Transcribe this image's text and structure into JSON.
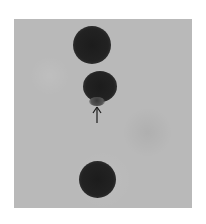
{
  "image": {
    "description": "Grayscale photograph showing three dark circular spots aligned vertically on a gray background, with an upward-pointing arrow indicating a small protrusion below the middle spot.",
    "background_color": "#b9b9b9",
    "spot_color": "#1c1c1c",
    "spots": [
      {
        "id": "top",
        "cx": 92,
        "cy": 45,
        "rx": 19,
        "ry": 19
      },
      {
        "id": "middle",
        "cx": 100,
        "cy": 86,
        "rx": 17,
        "ry": 15
      },
      {
        "id": "bottom",
        "cx": 97,
        "cy": 179,
        "rx": 18,
        "ry": 18
      }
    ],
    "annotation": {
      "type": "arrow",
      "direction": "up",
      "glyph": "↑",
      "x": 97,
      "y_top": 107,
      "y_bottom": 122
    }
  }
}
